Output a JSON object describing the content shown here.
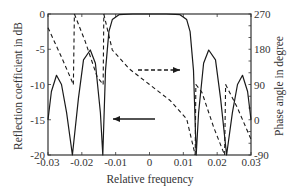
{
  "chart_data": {
    "type": "line",
    "title": "",
    "xlabel": "Relative frequency",
    "ylabel": "Reflection coefficient in dB",
    "y2label": "Phase angle in degree",
    "xlim": [
      -0.03,
      0.03
    ],
    "ylim": [
      -20,
      0
    ],
    "y2lim": [
      -90,
      270
    ],
    "grid": false,
    "legend": "none (arrows indicate axes: solid arrow points left to dB axis, dashed arrow points right to phase axis)",
    "x_ticks": [
      "-0.03",
      "-0.02",
      "-0.01",
      "0",
      "0.01",
      "0.02",
      "0.03"
    ],
    "y_ticks": [
      "0",
      "-5",
      "-10",
      "-15",
      "-20"
    ],
    "y2_ticks": [
      "270",
      "180",
      "90",
      "0",
      "-90"
    ],
    "series": [
      {
        "name": "Reflection coefficient (dB)",
        "axis": "left",
        "style": "solid",
        "x": [
          -0.03,
          -0.029,
          -0.0275,
          -0.026,
          -0.0245,
          -0.0228,
          -0.021,
          -0.0195,
          -0.0175,
          -0.016,
          -0.0145,
          -0.0138,
          -0.013,
          -0.012,
          -0.011,
          -0.009,
          -0.005,
          0,
          0.005,
          0.009,
          0.011,
          0.012,
          0.013,
          0.0138,
          0.0145,
          0.016,
          0.0175,
          0.0195,
          0.021,
          0.0228,
          0.0245,
          0.026,
          0.0275,
          0.029,
          0.03
        ],
        "values": [
          -15,
          -11,
          -8.7,
          -10,
          -14,
          -20,
          -12,
          -6.5,
          -5.1,
          -7,
          -14,
          -20,
          -8,
          -2.5,
          -0.8,
          -0.1,
          0,
          0,
          0,
          -0.1,
          -0.8,
          -2.5,
          -8,
          -20,
          -14,
          -7,
          -5.1,
          -6.5,
          -12,
          -20,
          -14,
          -10,
          -8.7,
          -11,
          -15
        ]
      },
      {
        "name": "Phase angle (degree)",
        "axis": "right",
        "style": "dashed",
        "x": [
          -0.03,
          -0.026,
          -0.0225,
          -0.0222,
          -0.019,
          -0.0155,
          -0.0137,
          -0.0135,
          -0.011,
          -0.006,
          0,
          0.006,
          0.011,
          0.0135,
          0.0137,
          0.0155,
          0.019,
          0.0222,
          0.0225,
          0.026,
          0.03
        ],
        "values": [
          235,
          160,
          90,
          270,
          200,
          110,
          90,
          270,
          178,
          130,
          90,
          50,
          2,
          -90,
          90,
          70,
          -20,
          -90,
          90,
          30,
          -50
        ]
      }
    ],
    "annotations": [
      {
        "type": "arrow",
        "style": "solid",
        "direction": "left",
        "meaning": "refers to left axis (dB)"
      },
      {
        "type": "arrow",
        "style": "dashed",
        "direction": "right",
        "meaning": "refers to right axis (phase)"
      }
    ]
  },
  "axes": {
    "x_title": "Relative frequency",
    "y_title": "Reflection coefficient in dB",
    "y2_title": "Phase angle in degree",
    "x_ticks": [
      "-0.03",
      "-0.02",
      "-0.01",
      "0",
      "0.01",
      "0.02",
      "0.03"
    ],
    "y_ticks": [
      "0",
      "-5",
      "-10",
      "-15",
      "-20"
    ],
    "y2_ticks": [
      "270",
      "180",
      "90",
      "0",
      "-90"
    ]
  },
  "colors": {
    "line": "#1a1a1a",
    "axis": "#333333",
    "background": "#ffffff"
  }
}
